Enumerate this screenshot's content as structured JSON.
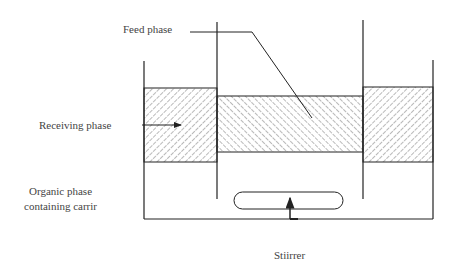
{
  "diagram": {
    "labels": {
      "feed_phase": "Feed phase",
      "receiving_phase": "Receiving phase",
      "organic_line1": "Organic phase",
      "organic_line2": "containing carrir",
      "stirrer": "Stiirrer"
    },
    "colors": {
      "line": "#222222",
      "hatch": "#888888",
      "text": "#444444"
    }
  }
}
